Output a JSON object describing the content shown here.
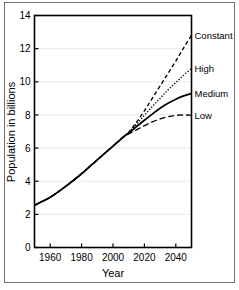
{
  "chart_data": {
    "type": "line",
    "title": "",
    "xlabel": "Year",
    "ylabel": "Population in billions",
    "xlim": [
      1950,
      2050
    ],
    "ylim": [
      0,
      14
    ],
    "grid": true,
    "legend_position": "right-inline-labels",
    "x_ticks": [
      1960,
      1980,
      2000,
      2020,
      2040
    ],
    "x_tick_labels": [
      "1960",
      "1980",
      "2000",
      "2020",
      "2040"
    ],
    "y_ticks": [
      0,
      2,
      4,
      6,
      8,
      10,
      12,
      14
    ],
    "y_tick_labels": [
      "0",
      "2",
      "4",
      "6",
      "8",
      "10",
      "12",
      "14"
    ],
    "x": [
      1950,
      1960,
      1970,
      1980,
      1990,
      2000,
      2007,
      2010,
      2015,
      2020,
      2025,
      2030,
      2035,
      2040,
      2045,
      2050
    ],
    "series": [
      {
        "name": "Constant",
        "label": "Constant",
        "style": "dashed",
        "color": "#000000",
        "values": [
          2.55,
          3.03,
          3.7,
          4.45,
          5.29,
          6.12,
          6.7,
          6.96,
          7.56,
          8.25,
          9.0,
          9.75,
          10.5,
          11.25,
          12.05,
          12.8
        ]
      },
      {
        "name": "High",
        "label": "High",
        "style": "dotted",
        "color": "#000000",
        "values": [
          2.55,
          3.03,
          3.7,
          4.45,
          5.29,
          6.12,
          6.7,
          6.95,
          7.45,
          7.98,
          8.5,
          9.0,
          9.5,
          9.95,
          10.4,
          10.8
        ]
      },
      {
        "name": "Medium",
        "label": "Medium",
        "style": "solid",
        "color": "#000000",
        "values": [
          2.55,
          3.03,
          3.7,
          4.45,
          5.29,
          6.12,
          6.7,
          6.9,
          7.3,
          7.68,
          8.05,
          8.4,
          8.7,
          8.95,
          9.15,
          9.3
        ]
      },
      {
        "name": "Low",
        "label": "Low",
        "style": "long-dashed",
        "color": "#000000",
        "values": [
          2.55,
          3.03,
          3.7,
          4.45,
          5.29,
          6.12,
          6.7,
          6.85,
          7.1,
          7.35,
          7.58,
          7.76,
          7.89,
          7.97,
          8.0,
          7.98
        ]
      }
    ],
    "annotations": [
      {
        "text": "Constant",
        "at_x": 2050,
        "at_y": 12.8
      },
      {
        "text": "High",
        "at_x": 2050,
        "at_y": 10.8
      },
      {
        "text": "Medium",
        "at_x": 2050,
        "at_y": 9.3
      },
      {
        "text": "Low",
        "at_x": 2050,
        "at_y": 7.98
      }
    ]
  }
}
